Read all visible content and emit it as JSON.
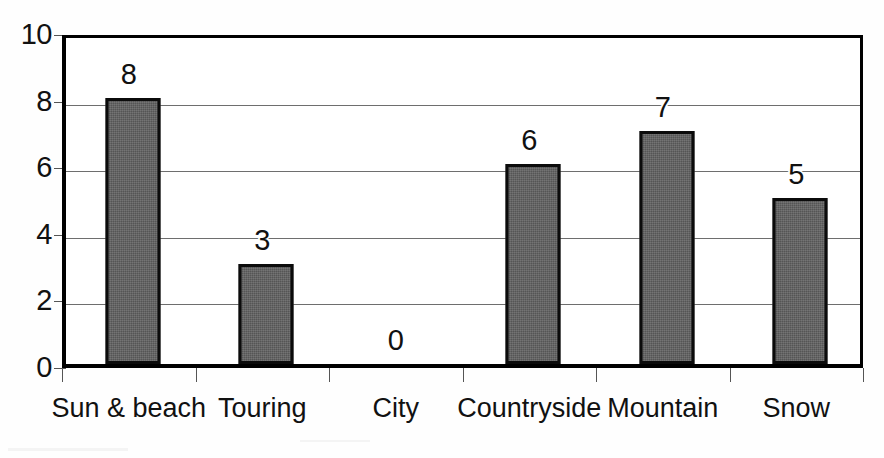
{
  "chart_data": {
    "type": "bar",
    "title": "",
    "subtitle": "",
    "xlabel": "",
    "ylabel": "",
    "categories": [
      "Sun & beach",
      "Touring",
      "City",
      "Countryside",
      "Mountain",
      "Snow"
    ],
    "values": [
      8,
      3,
      0,
      6,
      7,
      5
    ],
    "data_labels": [
      "8",
      "3",
      "0",
      "6",
      "7",
      "5"
    ],
    "ylim": [
      0,
      10
    ],
    "y_ticks": [
      0,
      2,
      4,
      6,
      8,
      10
    ],
    "y_tick_labels": [
      "0",
      "2",
      "4",
      "6",
      "8",
      "10"
    ],
    "grid": true,
    "grid_axis": "y",
    "legend": false,
    "legend_position": "none",
    "bar_color": "#555555",
    "bar_edge_color": "#0b0b0b",
    "axis_color": "#000000",
    "grid_color": "#6e6e6e",
    "background_color": "#ffffff"
  },
  "axes": {
    "y_axis_name": "value-axis",
    "x_axis_name": "category-axis"
  }
}
